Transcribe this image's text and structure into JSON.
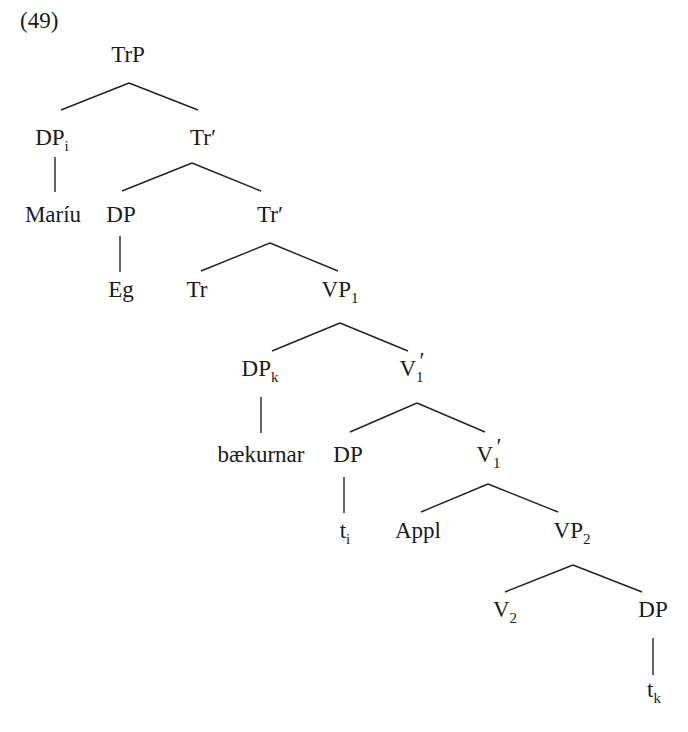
{
  "example_number": "(49)",
  "tree": {
    "nodes": [
      {
        "id": "n1",
        "label": "TrP",
        "sub": "",
        "prime": false,
        "x": 128,
        "y": 62
      },
      {
        "id": "n2",
        "label": "DP",
        "sub": "i",
        "prime": false,
        "x": 52,
        "y": 145
      },
      {
        "id": "n3",
        "label": "Tr",
        "sub": "",
        "prime": true,
        "x": 203,
        "y": 145
      },
      {
        "id": "n4",
        "label": "Maríu",
        "sub": "",
        "prime": false,
        "x": 53,
        "y": 222
      },
      {
        "id": "n5",
        "label": "DP",
        "sub": "",
        "prime": false,
        "x": 121,
        "y": 222
      },
      {
        "id": "n6",
        "label": "Tr",
        "sub": "",
        "prime": true,
        "x": 270,
        "y": 222
      },
      {
        "id": "n7",
        "label": "Eg",
        "sub": "",
        "prime": false,
        "x": 121,
        "y": 297
      },
      {
        "id": "n8",
        "label": "Tr",
        "sub": "",
        "prime": false,
        "x": 197,
        "y": 297
      },
      {
        "id": "n9",
        "label": "VP",
        "sub": "1",
        "prime": false,
        "x": 340,
        "y": 297
      },
      {
        "id": "n10",
        "label": "DP",
        "sub": "k",
        "prime": false,
        "x": 260,
        "y": 376
      },
      {
        "id": "n11",
        "label": "V",
        "sub": "1",
        "prime": true,
        "x": 412,
        "y": 376
      },
      {
        "id": "n12",
        "label": "bækurnar",
        "sub": "",
        "prime": false,
        "x": 261,
        "y": 462
      },
      {
        "id": "n13",
        "label": "DP",
        "sub": "",
        "prime": false,
        "x": 348,
        "y": 462
      },
      {
        "id": "n14",
        "label": "V",
        "sub": "1",
        "prime": true,
        "x": 489,
        "y": 462
      },
      {
        "id": "n15",
        "label": "t",
        "sub": "i",
        "prime": false,
        "x": 345,
        "y": 538
      },
      {
        "id": "n16",
        "label": "Appl",
        "sub": "",
        "prime": false,
        "x": 418,
        "y": 538
      },
      {
        "id": "n17",
        "label": "VP",
        "sub": "2",
        "prime": false,
        "x": 572,
        "y": 538
      },
      {
        "id": "n18",
        "label": "V",
        "sub": "2",
        "prime": false,
        "x": 505,
        "y": 617
      },
      {
        "id": "n19",
        "label": "DP",
        "sub": "",
        "prime": false,
        "x": 653,
        "y": 617
      },
      {
        "id": "n20",
        "label": "t",
        "sub": "k",
        "prime": false,
        "x": 654,
        "y": 697
      }
    ],
    "edges": [
      {
        "from": "n1",
        "to": "n2",
        "x1": 129,
        "y1": 83,
        "x2": 61,
        "y2": 110
      },
      {
        "from": "n1",
        "to": "n3",
        "x1": 129,
        "y1": 83,
        "x2": 198,
        "y2": 110
      },
      {
        "from": "n2",
        "to": "n4",
        "x1": 55,
        "y1": 157,
        "x2": 55,
        "y2": 192
      },
      {
        "from": "n3",
        "to": "n5",
        "x1": 192,
        "y1": 163,
        "x2": 122,
        "y2": 191
      },
      {
        "from": "n3",
        "to": "n6",
        "x1": 192,
        "y1": 163,
        "x2": 261,
        "y2": 191
      },
      {
        "from": "n5",
        "to": "n7",
        "x1": 120,
        "y1": 236,
        "x2": 120,
        "y2": 272
      },
      {
        "from": "n6",
        "to": "n8",
        "x1": 270,
        "y1": 243,
        "x2": 201,
        "y2": 271
      },
      {
        "from": "n6",
        "to": "n9",
        "x1": 270,
        "y1": 243,
        "x2": 338,
        "y2": 271
      },
      {
        "from": "n9",
        "to": "n10",
        "x1": 340,
        "y1": 323,
        "x2": 272,
        "y2": 351
      },
      {
        "from": "n9",
        "to": "n11",
        "x1": 340,
        "y1": 323,
        "x2": 408,
        "y2": 351
      },
      {
        "from": "n10",
        "to": "n12",
        "x1": 261,
        "y1": 397,
        "x2": 261,
        "y2": 433
      },
      {
        "from": "n11",
        "to": "n13",
        "x1": 417,
        "y1": 403,
        "x2": 350,
        "y2": 432
      },
      {
        "from": "n11",
        "to": "n14",
        "x1": 417,
        "y1": 403,
        "x2": 485,
        "y2": 432
      },
      {
        "from": "n13",
        "to": "n15",
        "x1": 344,
        "y1": 477,
        "x2": 344,
        "y2": 513
      },
      {
        "from": "n14",
        "to": "n16",
        "x1": 488,
        "y1": 484,
        "x2": 421,
        "y2": 512
      },
      {
        "from": "n14",
        "to": "n17",
        "x1": 488,
        "y1": 484,
        "x2": 558,
        "y2": 512
      },
      {
        "from": "n17",
        "to": "n18",
        "x1": 573,
        "y1": 565,
        "x2": 505,
        "y2": 592
      },
      {
        "from": "n17",
        "to": "n19",
        "x1": 573,
        "y1": 565,
        "x2": 642,
        "y2": 592
      },
      {
        "from": "n19",
        "to": "n20",
        "x1": 653,
        "y1": 638,
        "x2": 653,
        "y2": 675
      }
    ]
  }
}
